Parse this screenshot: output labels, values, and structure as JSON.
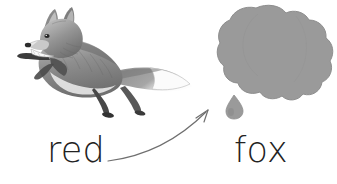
{
  "canvas": {
    "width": 337,
    "height": 184,
    "background_color": "#ffffff"
  },
  "illustration": {
    "fox": {
      "name": "leaping-fox-illustration",
      "description": "grayscale watercolor drawing of a fox leaping to the right",
      "body_color": "#8d8d8d",
      "shadow_color": "#5e5e5e",
      "dark_color": "#3a3a3a",
      "light_color": "#d2d2d2",
      "tail_tip_color": "#fcfcfc"
    },
    "blob": {
      "name": "gray-splat-blob",
      "description": "rounded cloud-like paint splat shape",
      "fill_color": "#9a9a9a",
      "edge_color": "#8e8e8e"
    },
    "drop": {
      "name": "paint-drop",
      "fill_color": "#9a9a9a"
    },
    "arrow": {
      "name": "curved-arrow",
      "description": "thin curved arrow from the word red to the blob",
      "stroke_color": "#6f6f6f",
      "stroke_width": 1.2
    }
  },
  "labels": {
    "red": "red",
    "fox": "fox"
  }
}
